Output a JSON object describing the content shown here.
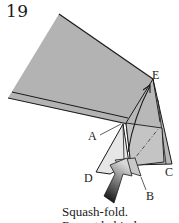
{
  "step": {
    "number": "19"
  },
  "labels": {
    "A": "A",
    "B": "B",
    "C": "C",
    "D": "D",
    "E": "E"
  },
  "caption": {
    "line1": "Squash-fold.",
    "line2": "Repeat behind."
  },
  "colors": {
    "paper": "#b3b3b3",
    "paper_light": "#cfcfcf",
    "paper_lightest": "#e6e6e6",
    "edge": "#1a1a1a",
    "arrow_dark": "#111111"
  }
}
